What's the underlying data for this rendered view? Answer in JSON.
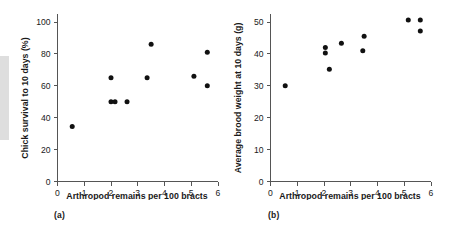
{
  "figure": {
    "scan_artifact": "gray-edge-bar"
  },
  "panels": [
    {
      "caption": "(a)",
      "xlabel": "Arthropod remains per 100 bracts",
      "ylabel": "Chick survival to 10 days (%)",
      "xticks": [
        "0",
        "1",
        "2",
        "3",
        "4",
        "5",
        "6"
      ],
      "yticks": [
        "0",
        "20",
        "40",
        "60",
        "80",
        "100"
      ]
    },
    {
      "caption": "(b)",
      "xlabel": "Arthropod remains per 100 bracts",
      "ylabel": "Average brood weight at 10 days (g)",
      "xticks": [
        "0",
        "1",
        "2",
        "3",
        "4",
        "5",
        "6"
      ],
      "yticks": [
        "0",
        "10",
        "20",
        "30",
        "40",
        "50"
      ]
    }
  ],
  "chart_data": [
    {
      "type": "scatter",
      "title": "",
      "panel": "(a)",
      "xlabel": "Arthropod remains per 100 bracts",
      "ylabel": "Chick survival to 10 days (%)",
      "xlim": [
        0,
        6
      ],
      "ylim": [
        0,
        105
      ],
      "xticks": [
        0,
        1,
        2,
        3,
        4,
        5,
        6
      ],
      "yticks": [
        0,
        20,
        40,
        60,
        80,
        100
      ],
      "grid": false,
      "legend": "none",
      "x": [
        0.55,
        2.0,
        2.0,
        2.15,
        2.6,
        3.35,
        3.5,
        5.1,
        5.6,
        5.6
      ],
      "y": [
        34.5,
        65,
        50,
        50,
        50,
        65,
        86,
        66,
        81,
        60
      ]
    },
    {
      "type": "scatter",
      "title": "",
      "panel": "(b)",
      "xlabel": "Arthropod remains per 100 bracts",
      "ylabel": "Average brood weight at 10 days (g)",
      "xlim": [
        0,
        6
      ],
      "ylim": [
        0,
        55
      ],
      "xticks": [
        0,
        1,
        2,
        3,
        4,
        5,
        6
      ],
      "yticks": [
        0,
        10,
        20,
        30,
        40,
        50
      ],
      "grid": false,
      "legend": "none",
      "x": [
        0.55,
        2.05,
        2.05,
        2.2,
        2.65,
        3.45,
        3.5,
        5.15,
        5.6,
        5.6
      ],
      "y": [
        30,
        42,
        40.3,
        35.2,
        43.3,
        41,
        45.5,
        50.6,
        50.6,
        47.2
      ]
    }
  ]
}
